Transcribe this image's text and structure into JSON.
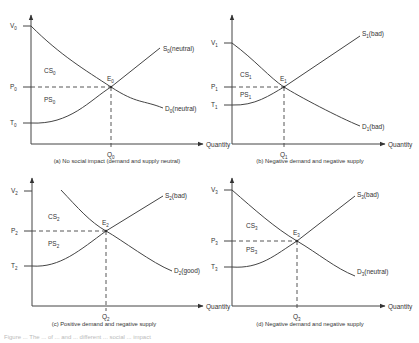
{
  "figure": {
    "x_axis_label": "Quantity",
    "panels": [
      {
        "id": "a",
        "caption": "(a) No social impact (demand and supply neutral)",
        "v_label": "V",
        "p_label": "P",
        "t_label": "T",
        "q_label": "Q",
        "e_label": "E",
        "sub": "0",
        "cs_label": "CS",
        "ps_label": "PS",
        "supply_label": "S",
        "supply_tag": "(neutral)",
        "demand_label": "D",
        "demand_tag": "(neutral)"
      },
      {
        "id": "b",
        "caption": "(b) Negative demand and negative supply",
        "v_label": "V",
        "p_label": "P",
        "t_label": "T",
        "q_label": "Q",
        "e_label": "E",
        "sub": "1",
        "cs_label": "CS",
        "ps_label": "PS",
        "supply_label": "S",
        "supply_tag": "(bad)",
        "demand_label": "D",
        "demand_tag": "(bad)"
      },
      {
        "id": "c",
        "caption": "(c) Positive demand and negative supply",
        "v_label": "V",
        "p_label": "P",
        "t_label": "T",
        "q_label": "Q",
        "e_label": "E",
        "sub": "2",
        "cs_label": "CS",
        "ps_label": "PS",
        "supply_label": "S",
        "supply_tag": "(bad)",
        "demand_label": "D",
        "demand_tag": "(good)"
      },
      {
        "id": "d",
        "caption": "(d) Negative demand and negative supply",
        "v_label": "V",
        "p_label": "P",
        "t_label": "T",
        "q_label": "Q",
        "e_label": "E",
        "sub": "3",
        "cs_label": "CS",
        "ps_label": "PS",
        "supply_label": "S",
        "supply_tag": "(bad)",
        "demand_label": "D",
        "demand_tag": "(neutral)"
      }
    ],
    "footer_caption_partial": "Figure ... The ... of ... and ... different ... social ... impact"
  }
}
